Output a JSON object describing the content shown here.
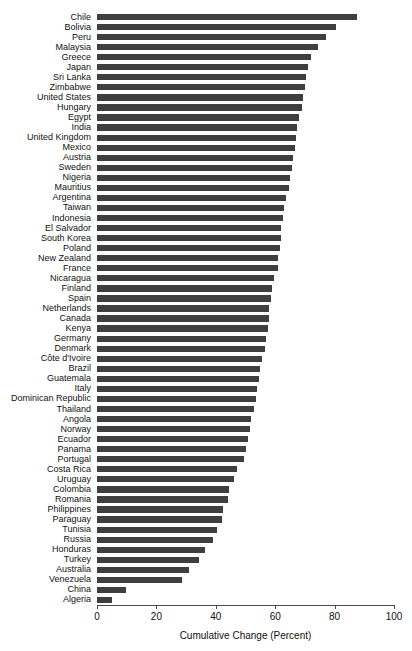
{
  "chart_data": {
    "type": "bar",
    "orientation": "horizontal",
    "title": "",
    "subtitle": "",
    "xlabel": "Cumulative Change (Percent)",
    "ylabel": "",
    "xlim": [
      0,
      100
    ],
    "xticks": [
      0,
      20,
      40,
      60,
      80,
      100
    ],
    "xtick_labels": [
      "0",
      "20",
      "40",
      "60",
      "80",
      "100"
    ],
    "grid": false,
    "legend": null,
    "bar_color": "#3f3f3f",
    "background_color": "#ffffff",
    "sorted": "descending",
    "categories": [
      "Chile",
      "Bolivia",
      "Peru",
      "Malaysia",
      "Greece",
      "Japan",
      "Sri Lanka",
      "Zimbabwe",
      "United States",
      "Hungary",
      "Egypt",
      "India",
      "United Kingdom",
      "Mexico",
      "Austria",
      "Sweden",
      "Nigeria",
      "Mauritius",
      "Argentina",
      "Taiwan",
      "Indonesia",
      "El Salvador",
      "South Korea",
      "Poland",
      "New Zealand",
      "France",
      "Nicaragua",
      "Finland",
      "Spain",
      "Netherlands",
      "Canada",
      "Kenya",
      "Germany",
      "Denmark",
      "Côte d'Ivoire",
      "Brazil",
      "Guatemala",
      "Italy",
      "Dominican Republic",
      "Thailand",
      "Angola",
      "Norway",
      "Ecuador",
      "Panama",
      "Portugal",
      "Costa Rica",
      "Uruguay",
      "Colombia",
      "Romania",
      "Philippines",
      "Paraguay",
      "Tunisia",
      "Russia",
      "Honduras",
      "Turkey",
      "Australia",
      "Venezuela",
      "China",
      "Algeria"
    ],
    "values": [
      87.5,
      80.5,
      77.0,
      74.5,
      72.0,
      71.0,
      70.5,
      70.0,
      69.5,
      69.0,
      68.0,
      67.5,
      67.0,
      66.5,
      66.0,
      65.5,
      65.0,
      64.5,
      63.5,
      63.0,
      62.5,
      62.0,
      62.0,
      61.5,
      61.0,
      61.0,
      59.5,
      59.0,
      58.5,
      58.0,
      58.0,
      57.5,
      57.0,
      56.5,
      55.5,
      55.0,
      54.5,
      54.0,
      53.5,
      53.0,
      52.0,
      51.5,
      51.0,
      50.0,
      49.5,
      47.0,
      46.0,
      44.5,
      44.0,
      42.5,
      42.0,
      40.5,
      39.0,
      36.5,
      34.5,
      31.0,
      28.5,
      9.6,
      5.2
    ],
    "value_unit": "percent",
    "n_categories": 59
  }
}
